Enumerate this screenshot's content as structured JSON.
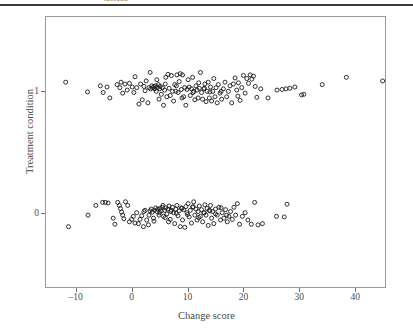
{
  "figure": {
    "caption_remnant": "ipercon",
    "background_color": "#ffffff",
    "frame_color": "#9a9a9a",
    "text_color": "#4a4a4a",
    "marker_color": "#1b1b1b"
  },
  "chart_data": {
    "type": "scatter",
    "title": "",
    "xlabel": "Change score",
    "ylabel": "Treatment condition",
    "xlim": [
      -15.5,
      45.5
    ],
    "ylim": [
      -0.62,
      1.62
    ],
    "xticks": [
      -10,
      0,
      10,
      20,
      30,
      40
    ],
    "xtick_labels": [
      "–10",
      "0",
      "10",
      "20",
      "30",
      "40"
    ],
    "yticks": [
      0,
      1
    ],
    "ytick_labels": [
      "0",
      "1"
    ],
    "grid": false,
    "legend": null,
    "marker": "open-circle",
    "marker_size": 4,
    "note": "Jittered strip plot: y is the binary treatment condition with vertical jitter; x is the change score.",
    "series": [
      {
        "name": "condition-1",
        "y_center": 1,
        "n": 131,
        "points": [
          [
            -11.8,
            1.075
          ],
          [
            -7.9,
            0.995
          ],
          [
            -5.6,
            1.045
          ],
          [
            -5.1,
            0.99
          ],
          [
            -4.4,
            1.035
          ],
          [
            -3.9,
            0.945
          ],
          [
            -2.6,
            1.055
          ],
          [
            -2.1,
            1.03
          ],
          [
            -1.9,
            1.075
          ],
          [
            -1.6,
            0.985
          ],
          [
            -1.2,
            1.06
          ],
          [
            -0.8,
            1.01
          ],
          [
            -0.4,
            1.065
          ],
          [
            0.1,
            1.035
          ],
          [
            0.4,
            0.99
          ],
          [
            0.6,
            1.12
          ],
          [
            0.9,
            1.03
          ],
          [
            1.3,
            0.895
          ],
          [
            1.6,
            1.06
          ],
          [
            1.9,
            0.93
          ],
          [
            2.2,
            1.04
          ],
          [
            2.4,
            1.005
          ],
          [
            2.6,
            1.085
          ],
          [
            2.9,
            0.905
          ],
          [
            3.1,
            1.03
          ],
          [
            3.3,
            1.155
          ],
          [
            3.4,
            1.02
          ],
          [
            3.6,
            1.045
          ],
          [
            3.8,
            1.03
          ],
          [
            4.0,
            1.04
          ],
          [
            4.1,
            1.02
          ],
          [
            4.3,
            1.045
          ],
          [
            4.4,
            1.0
          ],
          [
            4.6,
            1.03
          ],
          [
            4.8,
            1.055
          ],
          [
            4.9,
            0.935
          ],
          [
            5.1,
            1.04
          ],
          [
            5.3,
            0.975
          ],
          [
            5.5,
            1.03
          ],
          [
            5.7,
            0.885
          ],
          [
            5.9,
            1.01
          ],
          [
            6.1,
            1.115
          ],
          [
            6.3,
            0.955
          ],
          [
            6.5,
            1.14
          ],
          [
            6.7,
            1.025
          ],
          [
            6.9,
            0.965
          ],
          [
            7.1,
            1.13
          ],
          [
            7.3,
            1.0
          ],
          [
            7.5,
            0.92
          ],
          [
            7.7,
            1.055
          ],
          [
            7.9,
            1.0
          ],
          [
            8.1,
            1.135
          ],
          [
            8.3,
            0.99
          ],
          [
            8.5,
            1.08
          ],
          [
            8.7,
            1.145
          ],
          [
            8.9,
            1.015
          ],
          [
            9.1,
            1.135
          ],
          [
            9.3,
            0.955
          ],
          [
            9.5,
            1.03
          ],
          [
            9.7,
            0.885
          ],
          [
            9.9,
            1.015
          ],
          [
            10.1,
            1.095
          ],
          [
            10.3,
            1.035
          ],
          [
            10.5,
            0.965
          ],
          [
            10.7,
            1.02
          ],
          [
            10.9,
            1.115
          ],
          [
            11.1,
            1.0
          ],
          [
            11.3,
            0.93
          ],
          [
            11.5,
            1.045
          ],
          [
            11.7,
            1.01
          ],
          [
            11.9,
            0.945
          ],
          [
            12.1,
            1.025
          ],
          [
            12.3,
            1.155
          ],
          [
            12.5,
            0.99
          ],
          [
            12.7,
            0.935
          ],
          [
            12.9,
            1.02
          ],
          [
            13.1,
            1.06
          ],
          [
            13.3,
            0.915
          ],
          [
            13.5,
            1.0
          ],
          [
            13.7,
            1.075
          ],
          [
            13.9,
            0.945
          ],
          [
            14.1,
            1.035
          ],
          [
            14.3,
            0.92
          ],
          [
            14.5,
            1.0
          ],
          [
            14.7,
            1.105
          ],
          [
            14.9,
            0.955
          ],
          [
            15.1,
            1.03
          ],
          [
            15.3,
            0.905
          ],
          [
            15.5,
            1.055
          ],
          [
            15.8,
            0.985
          ],
          [
            16.1,
            0.935
          ],
          [
            16.4,
            1.02
          ],
          [
            16.7,
            1.075
          ],
          [
            17.0,
            0.955
          ],
          [
            17.3,
            1.0
          ],
          [
            17.6,
            1.045
          ],
          [
            17.9,
            0.905
          ],
          [
            18.2,
            1.06
          ],
          [
            18.5,
            1.11
          ],
          [
            18.8,
            1.01
          ],
          [
            19.1,
            1.07
          ],
          [
            19.4,
            0.925
          ],
          [
            19.7,
            1.03
          ],
          [
            20.0,
            1.13
          ],
          [
            20.3,
            0.985
          ],
          [
            20.6,
            1.105
          ],
          [
            20.9,
            1.065
          ],
          [
            21.2,
            1.135
          ],
          [
            21.5,
            1.1
          ],
          [
            21.8,
            1.125
          ],
          [
            22.1,
            1.04
          ],
          [
            22.4,
            0.95
          ],
          [
            23.1,
            1.02
          ],
          [
            24.4,
            0.945
          ],
          [
            26.0,
            1.01
          ],
          [
            26.9,
            1.015
          ],
          [
            27.6,
            1.02
          ],
          [
            28.3,
            1.025
          ],
          [
            29.2,
            1.035
          ],
          [
            30.4,
            0.97
          ],
          [
            30.8,
            0.975
          ],
          [
            34.1,
            1.055
          ],
          [
            38.4,
            1.115
          ],
          [
            44.9,
            1.085
          ],
          [
            5.0,
            1.02
          ],
          [
            8.0,
            1.045
          ],
          [
            11.0,
            0.99
          ],
          [
            14.0,
            0.995
          ],
          [
            6.0,
            1.06
          ],
          [
            9.0,
            0.945
          ],
          [
            12.0,
            1.07
          ],
          [
            4.5,
            1.095
          ],
          [
            16.0,
            1.0
          ],
          [
            19.0,
            0.96
          ],
          [
            13.0,
            1.025
          ]
        ]
      },
      {
        "name": "condition-0",
        "y_center": 0,
        "n": 129,
        "points": [
          [
            -11.3,
            -0.115
          ],
          [
            -7.8,
            -0.02
          ],
          [
            -6.4,
            0.06
          ],
          [
            -5.2,
            0.085
          ],
          [
            -4.7,
            0.085
          ],
          [
            -4.2,
            0.08
          ],
          [
            -3.3,
            -0.045
          ],
          [
            -3.0,
            -0.095
          ],
          [
            -2.5,
            0.085
          ],
          [
            -2.2,
            0.06
          ],
          [
            -2.0,
            0.035
          ],
          [
            -1.8,
            0.005
          ],
          [
            -1.6,
            -0.02
          ],
          [
            -1.4,
            -0.05
          ],
          [
            -1.1,
            0.09
          ],
          [
            -0.7,
            0.06
          ],
          [
            -0.4,
            -0.075
          ],
          [
            0.0,
            -0.055
          ],
          [
            0.3,
            -0.03
          ],
          [
            0.6,
            -0.085
          ],
          [
            0.9,
            0.0
          ],
          [
            1.2,
            -0.09
          ],
          [
            1.5,
            -0.055
          ],
          [
            1.8,
            -0.025
          ],
          [
            2.1,
            -0.115
          ],
          [
            2.4,
            0.02
          ],
          [
            2.7,
            -0.06
          ],
          [
            3.0,
            -0.1
          ],
          [
            3.3,
            0.015
          ],
          [
            3.5,
            0.03
          ],
          [
            3.7,
            0.005
          ],
          [
            3.9,
            -0.045
          ],
          [
            4.1,
            0.02
          ],
          [
            4.3,
            0.04
          ],
          [
            4.5,
            0.01
          ],
          [
            4.7,
            0.03
          ],
          [
            4.9,
            -0.02
          ],
          [
            5.1,
            0.035
          ],
          [
            5.3,
            0.015
          ],
          [
            5.5,
            0.045
          ],
          [
            5.7,
            -0.03
          ],
          [
            5.9,
            0.02
          ],
          [
            6.1,
            0.04
          ],
          [
            6.3,
            -0.01
          ],
          [
            6.5,
            0.03
          ],
          [
            6.7,
            0.055
          ],
          [
            6.9,
            -0.055
          ],
          [
            7.1,
            0.02
          ],
          [
            7.3,
            0.045
          ],
          [
            7.5,
            0.0
          ],
          [
            7.7,
            -0.09
          ],
          [
            7.9,
            0.03
          ],
          [
            8.1,
            0.06
          ],
          [
            8.3,
            -0.025
          ],
          [
            8.5,
            0.015
          ],
          [
            8.7,
            -0.115
          ],
          [
            8.9,
            0.04
          ],
          [
            9.1,
            -0.06
          ],
          [
            9.3,
            0.025
          ],
          [
            9.5,
            -0.12
          ],
          [
            9.7,
            0.05
          ],
          [
            9.9,
            0.0
          ],
          [
            10.1,
            0.075
          ],
          [
            10.3,
            -0.035
          ],
          [
            10.5,
            0.02
          ],
          [
            10.7,
            -0.085
          ],
          [
            10.9,
            0.045
          ],
          [
            11.1,
            0.09
          ],
          [
            11.3,
            -0.02
          ],
          [
            11.5,
            0.03
          ],
          [
            11.7,
            -0.06
          ],
          [
            11.9,
            0.01
          ],
          [
            12.1,
            0.055
          ],
          [
            12.3,
            -0.03
          ],
          [
            12.5,
            0.025
          ],
          [
            12.7,
            -0.075
          ],
          [
            12.9,
            0.0
          ],
          [
            13.1,
            0.065
          ],
          [
            13.3,
            -0.02
          ],
          [
            13.5,
            0.035
          ],
          [
            13.7,
            -0.105
          ],
          [
            13.9,
            0.02
          ],
          [
            14.1,
            0.06
          ],
          [
            14.3,
            -0.045
          ],
          [
            14.5,
            0.01
          ],
          [
            14.7,
            -0.09
          ],
          [
            15.0,
            0.03
          ],
          [
            15.3,
            -0.02
          ],
          [
            15.6,
            0.045
          ],
          [
            15.9,
            -0.06
          ],
          [
            16.2,
            0.0
          ],
          [
            16.5,
            -0.045
          ],
          [
            16.8,
            0.025
          ],
          [
            17.1,
            -0.075
          ],
          [
            17.4,
            -0.03
          ],
          [
            17.7,
            0.01
          ],
          [
            18.0,
            -0.055
          ],
          [
            18.3,
            0.045
          ],
          [
            18.6,
            -0.02
          ],
          [
            18.9,
            0.075
          ],
          [
            19.3,
            -0.095
          ],
          [
            19.8,
            -0.03
          ],
          [
            20.3,
            0.0
          ],
          [
            20.8,
            -0.06
          ],
          [
            21.4,
            -0.095
          ],
          [
            22.0,
            0.085
          ],
          [
            22.6,
            -0.1
          ],
          [
            23.4,
            -0.09
          ],
          [
            25.9,
            -0.03
          ],
          [
            27.3,
            -0.035
          ],
          [
            27.8,
            0.07
          ],
          [
            2.2,
            0.01
          ],
          [
            3.1,
            -0.02
          ],
          [
            5.0,
            0.0
          ],
          [
            6.0,
            -0.04
          ],
          [
            7.0,
            0.01
          ],
          [
            8.0,
            -0.005
          ],
          [
            9.0,
            0.035
          ],
          [
            10.0,
            -0.015
          ],
          [
            11.0,
            0.05
          ],
          [
            12.0,
            -0.04
          ],
          [
            13.0,
            0.0
          ],
          [
            4.0,
            -0.07
          ],
          [
            14.0,
            0.015
          ],
          [
            15.0,
            -0.01
          ],
          [
            16.0,
            0.04
          ],
          [
            17.0,
            -0.02
          ],
          [
            6.6,
            -0.075
          ],
          [
            5.6,
            0.06
          ]
        ]
      }
    ]
  }
}
